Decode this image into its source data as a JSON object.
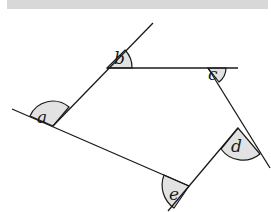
{
  "figure": {
    "type": "polygon-exterior-angles",
    "colors": {
      "line": "#1a1a1a",
      "angle_fill": "#e2e2e2",
      "top_band": "#d8d8d8"
    },
    "angles": [
      {
        "id": "a",
        "label": "a"
      },
      {
        "id": "b",
        "label": "b"
      },
      {
        "id": "c",
        "label": "c"
      },
      {
        "id": "d",
        "label": "d"
      },
      {
        "id": "e",
        "label": "e"
      }
    ]
  }
}
